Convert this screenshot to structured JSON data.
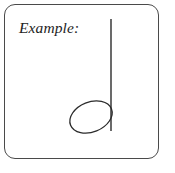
{
  "figure": {
    "caption_label": "Example:",
    "background_color": "#ffffff"
  },
  "frame": {
    "name": "rounded-rectangle-border",
    "stroke_color": "#4a4a4a",
    "stroke_width": 1.2,
    "corner_radius": 11,
    "x": 4,
    "y": 4,
    "width": 155,
    "height": 155
  },
  "music": {
    "symbol_name": "half-note",
    "symbol_description": "half note (minim): hollow oval notehead with upward stem",
    "stroke_color": "#2b2b2b",
    "notehead": {
      "name": "open-notehead",
      "fill": "none",
      "center_x": 91,
      "center_y": 117,
      "radius_x": 22,
      "radius_y": 15,
      "rotation_deg": -22,
      "stroke_width": 1.3
    },
    "stem": {
      "name": "note-stem",
      "x": 111,
      "y_top": 19,
      "y_bottom": 131,
      "stroke_width": 1.4,
      "direction": "up"
    }
  }
}
